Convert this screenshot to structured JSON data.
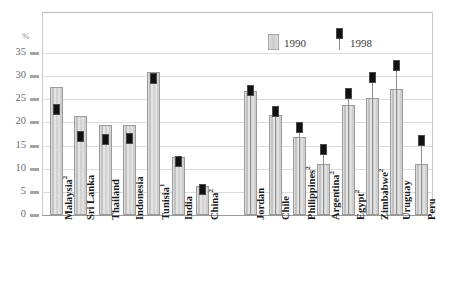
{
  "chart_data": {
    "type": "bar",
    "title": "",
    "subtitle": "",
    "xlabel": "",
    "ylabel": "%",
    "ylim": [
      0,
      35
    ],
    "yticks": [
      0,
      5,
      10,
      15,
      20,
      25,
      30,
      35
    ],
    "grid": true,
    "legend_position": "top-center",
    "categories": [
      "Malaysia²",
      "Sri Lanka",
      "Thailand",
      "Indonesia",
      "Tunisia¹",
      "India",
      "China²",
      "",
      "Jordan",
      "Chile",
      "Philippines²",
      "Argentina²",
      "Egypt²",
      "Zimbabwe²",
      "Uruguay",
      "Peru"
    ],
    "series": [
      {
        "name": "1990",
        "color": "#d2d2d2",
        "style": "bar",
        "values": [
          27.6,
          21.5,
          19.4,
          19.4,
          30.9,
          12.5,
          6.3,
          null,
          26.8,
          21.6,
          16.8,
          11.0,
          23.7,
          25.3,
          27.3,
          11.0
        ]
      },
      {
        "name": "1998",
        "color": "#111111",
        "style": "marker",
        "values": [
          22.9,
          17.0,
          16.3,
          16.6,
          29.4,
          11.6,
          5.6,
          null,
          27.0,
          22.3,
          19.0,
          14.2,
          26.3,
          29.8,
          32.3,
          16.0
        ]
      }
    ]
  },
  "legend": {
    "items": [
      {
        "label": "1990",
        "swatch": "gray-bar-swatch"
      },
      {
        "label": "1998",
        "swatch": "black-marker-swatch"
      }
    ]
  },
  "axis": {
    "unit_label": "%",
    "tick_labels": [
      "35",
      "30",
      "25",
      "20",
      "15",
      "10",
      "5",
      "0"
    ]
  }
}
